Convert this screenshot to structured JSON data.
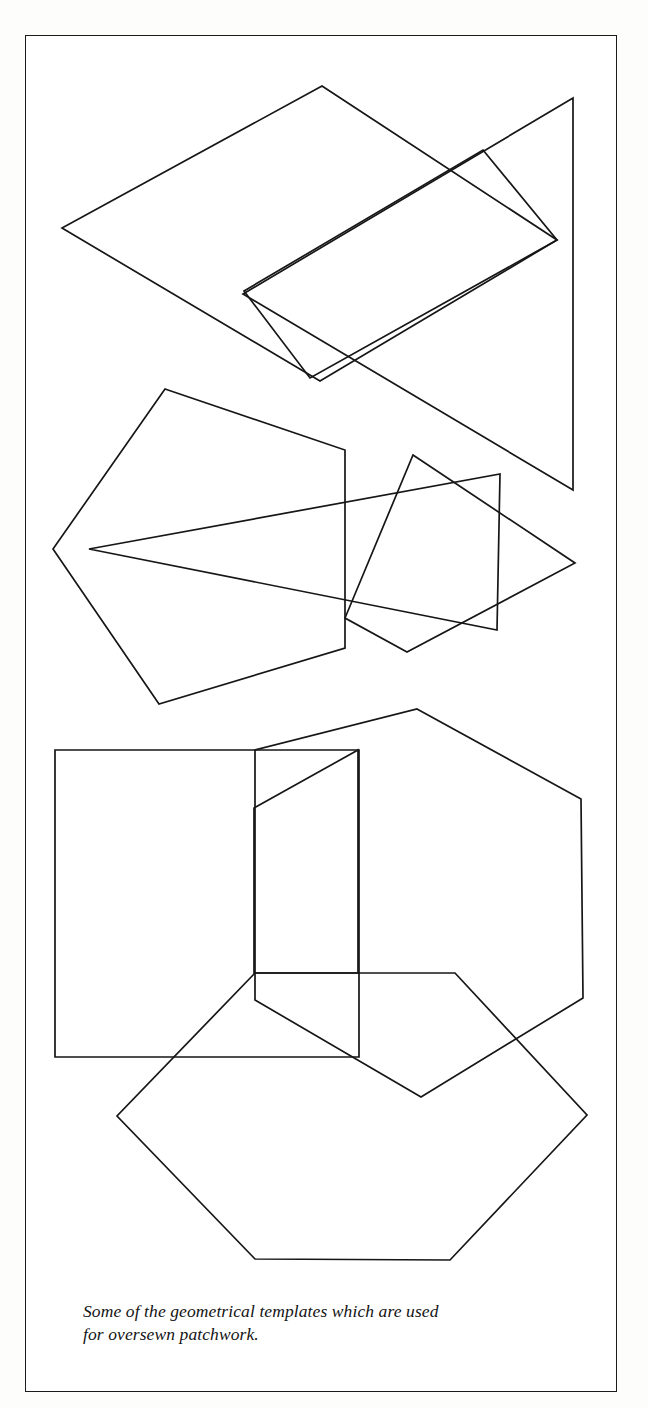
{
  "page": {
    "background_color": "#fdfdfc",
    "plate_background": "#ffffff",
    "border_color": "#1b1b1b",
    "ink_color": "#161616"
  },
  "caption": {
    "full_text": "Some of the geometrical templates which are used for oversewn patchwork.",
    "line1": "Some of the geometrical templates which are used",
    "line2": "for oversewn patchwork."
  },
  "figure": {
    "groups": [
      {
        "name": "top-group",
        "shapes": [
          {
            "name": "large-diamond",
            "type": "rhombus",
            "sides": 4,
            "points": "322,86 557,240 320,381 62,228"
          },
          {
            "name": "small-rhombus",
            "type": "rhombus",
            "sides": 4,
            "points": "483,150 557,240 310,378 244,291"
          },
          {
            "name": "right-triangle",
            "type": "triangle",
            "sides": 3,
            "points": "573,98 573,490 243,294"
          }
        ]
      },
      {
        "name": "middle-group",
        "shapes": [
          {
            "name": "pentagon-left",
            "type": "pentagon",
            "sides": 5,
            "points": "165,389 345,450 345,648 159,704 53,549"
          },
          {
            "name": "kite-right",
            "type": "kite",
            "sides": 4,
            "points": "413,455 575,563 407,652 345,618"
          },
          {
            "name": "long-triangle",
            "type": "triangle",
            "sides": 3,
            "points": "89,549 500,474 497,630"
          }
        ]
      },
      {
        "name": "bottom-group",
        "shapes": [
          {
            "name": "square",
            "type": "square",
            "sides": 4,
            "points": "55,750 359,750 359,1057 55,1057"
          },
          {
            "name": "hexagon-upper",
            "type": "hexagon",
            "sides": 6,
            "points": "417,709 581,799 583,998 421,1097 255,1000 255,750"
          },
          {
            "name": "pentagon-middle",
            "type": "pentagon",
            "sides": 5,
            "points": "358,750 358,973 254,973 254,808"
          },
          {
            "name": "hexagon-lower",
            "type": "hexagon",
            "sides": 6,
            "points": "255,973 455,973 587,1115 450,1260 255,1259 117,1116"
          }
        ]
      }
    ]
  }
}
